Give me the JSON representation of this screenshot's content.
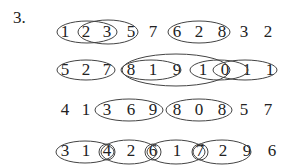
{
  "problem": {
    "number_label": "3.",
    "rows": [
      {
        "digits": [
          "1",
          "2",
          "3",
          "5",
          "7",
          "6",
          "2",
          "8",
          "3",
          "2"
        ],
        "groups": [
          [
            "1",
            "2",
            "3"
          ],
          [
            "2",
            "3",
            "5"
          ],
          [
            "6",
            "2",
            "8"
          ]
        ]
      },
      {
        "digits": [
          "5",
          "2",
          "7",
          "8",
          "1",
          "9",
          "1",
          "0",
          "1",
          "1"
        ],
        "groups": [
          [
            "5",
            "2",
            "7"
          ],
          [
            "8",
            "1",
            "9"
          ],
          [
            "1",
            "9",
            "1",
            "0"
          ],
          [
            "1",
            "0",
            "1"
          ],
          [
            "0",
            "1",
            "1"
          ]
        ]
      },
      {
        "digits": [
          "4",
          "1",
          "3",
          "6",
          "9",
          "8",
          "0",
          "8",
          "5",
          "7"
        ],
        "groups": [
          [
            "3",
            "6",
            "9"
          ],
          [
            "8",
            "0",
            "8"
          ]
        ]
      },
      {
        "digits": [
          "3",
          "1",
          "4",
          "2",
          "6",
          "1",
          "7",
          "2",
          "9",
          "6"
        ],
        "groups": [
          [
            "3",
            "1",
            "4"
          ],
          [
            "4",
            "2",
            "6"
          ],
          [
            "6",
            "1",
            "7"
          ],
          [
            "7",
            "2",
            "9"
          ]
        ]
      }
    ]
  }
}
